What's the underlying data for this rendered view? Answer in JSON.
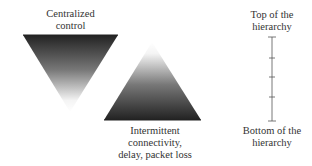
{
  "diagram": {
    "inverted_triangle": {
      "label_lines": [
        "Centralized",
        "control"
      ],
      "color_dark": "#222222",
      "color_light": "#ffffff"
    },
    "upright_triangle": {
      "label_lines": [
        "Intermittent",
        "connectivity,",
        "delay, packet loss"
      ],
      "color_dark": "#222222",
      "color_light": "#ffffff"
    },
    "hierarchy_axis": {
      "top_label_lines": [
        "Top of the",
        "hierarchy"
      ],
      "bottom_label_lines": [
        "Bottom of the",
        "hierarchy"
      ],
      "tick_count": 5,
      "line_color": "#555555"
    }
  }
}
